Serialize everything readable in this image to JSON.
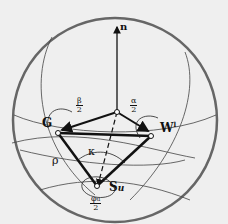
{
  "diagram": {
    "labels": {
      "normal": "n",
      "vertex_g": "G",
      "vertex_w": "W",
      "vertex_w_sup": "l",
      "vertex_s": "S",
      "vertex_s_sub": "u",
      "kappa": "κ",
      "rho": "ρ",
      "beta_half_num": "β",
      "beta_half_den": "2",
      "alpha_half_num": "α",
      "alpha_half_den": "2",
      "phi_half_num": "φ",
      "phi_half_num_sub": "u",
      "phi_half_den": "2"
    },
    "colors": {
      "sphere": "#555555",
      "lines": "#111111",
      "background": "#efefef"
    }
  }
}
